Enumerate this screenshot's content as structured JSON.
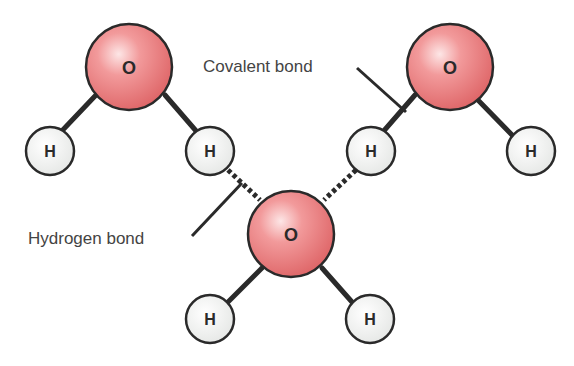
{
  "diagram": {
    "labels": {
      "covalent_bond": "Covalent bond",
      "hydrogen_bond": "Hydrogen bond"
    },
    "atoms": {
      "oxygen_symbol": "O",
      "hydrogen_symbol": "H"
    },
    "molecules": [
      {
        "name": "water-molecule-top-left",
        "oxygen": "O",
        "hydrogens": [
          "H",
          "H"
        ]
      },
      {
        "name": "water-molecule-top-right",
        "oxygen": "O",
        "hydrogens": [
          "H",
          "H"
        ]
      },
      {
        "name": "water-molecule-bottom-center",
        "oxygen": "O",
        "hydrogens": [
          "H",
          "H"
        ]
      }
    ],
    "colors": {
      "oxygen_fill": "#e8787a",
      "oxygen_highlight": "#fbe0e0",
      "hydrogen_fill": "#f2f2f2",
      "outline": "#2a2a2a",
      "text": "#444444"
    }
  }
}
